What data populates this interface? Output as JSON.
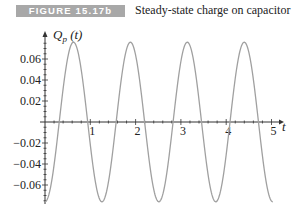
{
  "figure": {
    "badge": "FIGURE 15.17b",
    "caption": "Steady-state charge on capacitor",
    "badge_color": "#a8a8a8"
  },
  "chart_data": {
    "type": "line",
    "title": "Steady-state charge on capacitor",
    "xlabel": "t",
    "ylabel": "Q_p (t)",
    "xlim": [
      0,
      5.1
    ],
    "ylim": [
      -0.078,
      0.078
    ],
    "x_ticks": [
      1,
      2,
      3,
      4,
      5
    ],
    "x_tick_labels": [
      "1",
      "2",
      "3",
      "4",
      "5"
    ],
    "y_ticks": [
      0.06,
      0.04,
      0.02,
      -0.02,
      -0.04,
      -0.06
    ],
    "y_tick_labels": [
      "0.06",
      "0.04",
      "0.02",
      "−0.02",
      "−0.04",
      "−0.06"
    ],
    "grid": false,
    "legend": null,
    "line_color": "#a0a0a0",
    "series": [
      {
        "name": "Q_p(t)",
        "description": "sinusoid approx -0.076*cos(5t), t from 0 to ~5.03",
        "x": [
          0,
          0.314,
          0.628,
          0.942,
          1.257,
          1.571,
          1.885,
          2.199,
          2.513,
          2.827,
          3.142,
          3.456,
          3.77,
          4.084,
          4.398,
          4.712,
          5.027
        ],
        "values": [
          -0.076,
          0.0,
          0.076,
          0.0,
          -0.076,
          0.0,
          0.076,
          0.0,
          -0.076,
          0.0,
          0.076,
          0.0,
          -0.076,
          0.0,
          0.076,
          0.0,
          -0.076
        ]
      }
    ],
    "curve": {
      "amplitude": 0.076,
      "omega": 5,
      "phase_sign": -1,
      "t_start": 0,
      "t_end": 5.03
    }
  }
}
